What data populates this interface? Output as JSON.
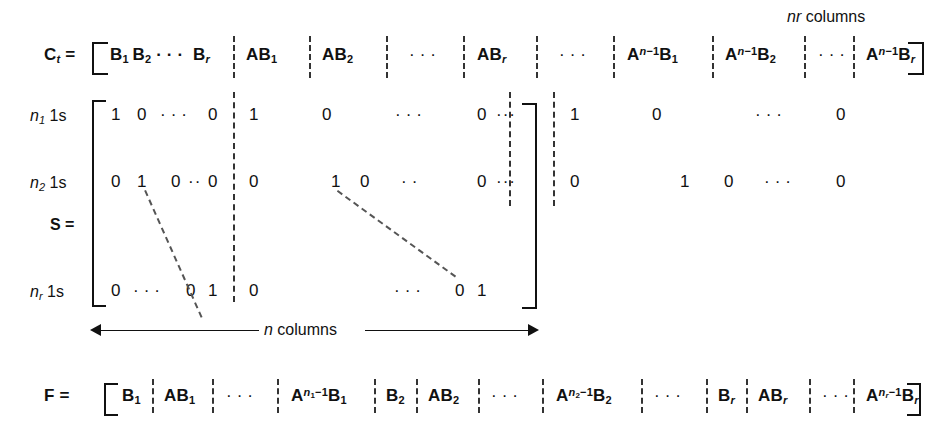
{
  "figure": {
    "background": "#ffffff",
    "ink": "#111111"
  },
  "annotations": {
    "nr_columns": "nr columns",
    "n_columns": "n columns"
  },
  "ct_row": {
    "lhs": "C",
    "lhs_sub": "t",
    "equals": "=",
    "cells": [
      "B₁ B₂ ··· Bᵣ",
      "AB₁",
      "AB₂",
      "· · ·",
      "ABᵣ",
      "· · ·",
      "Aⁿ⁻¹B₁",
      "Aⁿ⁻¹B₂",
      "· · ·",
      "Aⁿ⁻¹Bᵣ"
    ]
  },
  "s_matrix": {
    "lhs": "S",
    "equals": "=",
    "row_labels": [
      {
        "n": "n",
        "sub": "1",
        "suffix": "1s"
      },
      {
        "n": "n",
        "sub": "2",
        "suffix": "1s"
      },
      {
        "n": "n",
        "sub": "r",
        "suffix": "1s"
      }
    ],
    "rows": [
      {
        "block1": [
          "1",
          "0",
          "· · ·",
          "0"
        ],
        "block2": [
          "1",
          "0",
          "· · ·",
          "0"
        ],
        "gap": "· · ·",
        "block3": [
          "1",
          "0",
          "· · ·",
          "0"
        ]
      },
      {
        "block1": [
          "0",
          "1",
          "0",
          "··",
          "0"
        ],
        "block2": [
          "0",
          "1",
          "0",
          "· ·",
          "0"
        ],
        "gap": "· · ·",
        "block3": [
          "0",
          "1",
          "0",
          "· · ·",
          "0"
        ]
      },
      {
        "block1": [
          "0",
          "· · ·",
          "0",
          "1"
        ],
        "block2": [
          "0",
          "· · ·",
          "0",
          "1"
        ]
      }
    ]
  },
  "f_row": {
    "lhs": "F",
    "equals": "=",
    "cells": [
      "B₁",
      "AB₁",
      "· · ·",
      "Aⁿ¹⁻¹B₁",
      "B₂",
      "AB₂",
      "· · ·",
      "Aⁿ²⁻¹B₂",
      "· · ·",
      "Bᵣ",
      "ABᵣ",
      "· · ·",
      "Aⁿʳ⁻¹Bᵣ"
    ]
  }
}
